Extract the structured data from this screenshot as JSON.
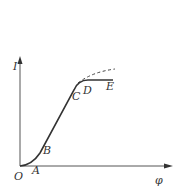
{
  "diagram": {
    "axes": {
      "y_label": "I",
      "x_label": "φ",
      "origin_label": "O"
    },
    "points": [
      {
        "id": "A",
        "label": "A"
      },
      {
        "id": "B",
        "label": "B"
      },
      {
        "id": "C",
        "label": "C"
      },
      {
        "id": "D",
        "label": "D"
      },
      {
        "id": "E",
        "label": "E"
      }
    ],
    "curves": [
      {
        "name": "solid-curve",
        "style": "solid",
        "path": "O-A-B-C-D-E"
      },
      {
        "name": "dashed-extension",
        "style": "dashed",
        "path": "C onward rising"
      }
    ],
    "colors": {
      "line": "#333333",
      "axis": "#555555",
      "background": "#ffffff"
    }
  }
}
